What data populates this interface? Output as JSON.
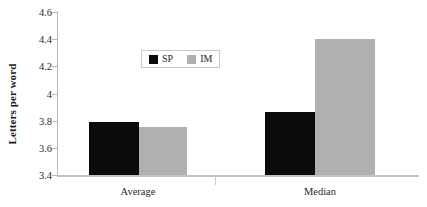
{
  "chart_data": {
    "type": "bar",
    "title": "",
    "xlabel": "",
    "ylabel": "Letters per word",
    "categories": [
      "Average",
      "Median"
    ],
    "series": [
      {
        "name": "SP",
        "color": "#0b0b0b",
        "values": [
          3.79,
          3.86
        ]
      },
      {
        "name": "IM",
        "color": "#b0b0b0",
        "values": [
          3.75,
          4.4
        ]
      }
    ],
    "ylim": [
      3.4,
      4.6
    ],
    "yticks": [
      3.4,
      3.6,
      3.8,
      4.0,
      4.2,
      4.4,
      4.6
    ],
    "ytick_labels": [
      "3.4",
      "3.6",
      "3.8",
      "4",
      "4.2",
      "4.4",
      "4.6"
    ],
    "grid": false,
    "legend_position": "upper-center"
  },
  "legend": {
    "entries": [
      {
        "label": "SP",
        "swatch": "black-square-swatch"
      },
      {
        "label": "IM",
        "swatch": "gray-square-swatch"
      }
    ]
  }
}
